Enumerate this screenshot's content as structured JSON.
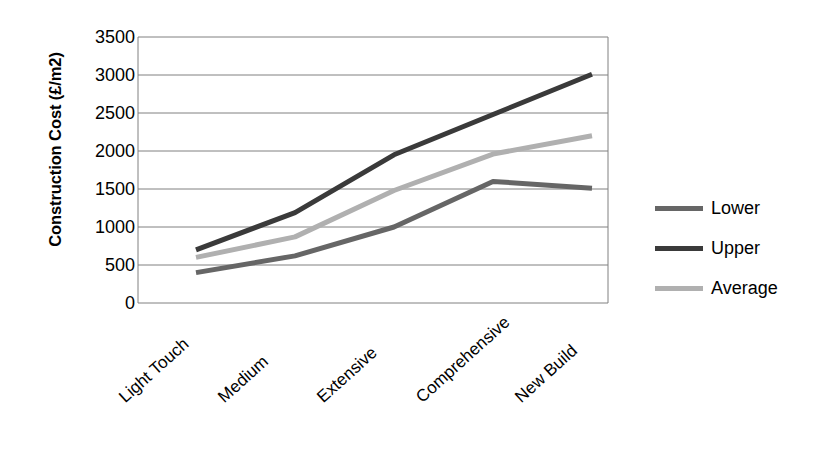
{
  "chart_data": {
    "type": "line",
    "title": "",
    "xlabel": "",
    "ylabel": "Construction Cost (£/m2)",
    "categories": [
      "Light Touch",
      "Medium",
      "Extensive",
      "Comprehensive",
      "New Build"
    ],
    "series": [
      {
        "name": "Lower",
        "values": [
          400,
          620,
          1000,
          1600,
          1510
        ],
        "color": "#666666"
      },
      {
        "name": "Upper",
        "values": [
          700,
          1190,
          1950,
          2480,
          3010
        ],
        "color": "#3a3a3a"
      },
      {
        "name": "Average",
        "values": [
          600,
          870,
          1480,
          1960,
          2200
        ],
        "color": "#b0b0b0"
      }
    ],
    "ylim": [
      0,
      3500
    ],
    "ytick_values": [
      0,
      500,
      1000,
      1500,
      2000,
      2500,
      3000,
      3500
    ],
    "ytick_labels": [
      "0",
      "500",
      "1000",
      "1500",
      "2000",
      "2500",
      "3000",
      "3500"
    ],
    "grid": "horizontal",
    "legend_position": "right",
    "legend_entries": [
      "Lower",
      "Upper",
      "Average"
    ],
    "plot_border_color": "#808080",
    "gridline_color": "#808080",
    "background_color": "#ffffff"
  }
}
